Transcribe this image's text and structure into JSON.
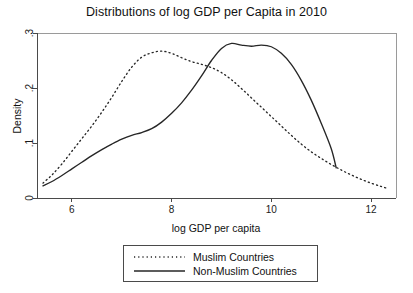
{
  "chart_data": {
    "type": "line",
    "title": "Distributions of log GDP per Capita in 2010",
    "xlabel": "log GDP per capita",
    "ylabel": "Density",
    "xlim": [
      5.3,
      12.5
    ],
    "ylim": [
      0,
      0.3
    ],
    "xticks": [
      "6",
      "8",
      "10",
      "12"
    ],
    "xtick_values": [
      6,
      8,
      10,
      12
    ],
    "yticks": [
      "0",
      ".1",
      ".2",
      ".3"
    ],
    "ytick_values": [
      0,
      0.1,
      0.2,
      0.3
    ],
    "grid": false,
    "legend_position": "below-axes",
    "series": [
      {
        "name": "Muslim Countries",
        "style": "dotted",
        "color": "#262626",
        "x": [
          5.42,
          5.6,
          5.8,
          6.0,
          6.2,
          6.4,
          6.6,
          6.8,
          7.0,
          7.2,
          7.4,
          7.6,
          7.8,
          8.0,
          8.2,
          8.4,
          8.6,
          8.8,
          9.0,
          9.2,
          9.4,
          9.6,
          9.8,
          10.0,
          10.2,
          10.4,
          10.6,
          10.8,
          11.0,
          11.2,
          11.4,
          11.6,
          11.8,
          12.0,
          12.2,
          12.35
        ],
        "y": [
          0.027,
          0.042,
          0.062,
          0.085,
          0.108,
          0.131,
          0.156,
          0.183,
          0.212,
          0.238,
          0.256,
          0.264,
          0.267,
          0.263,
          0.255,
          0.248,
          0.243,
          0.237,
          0.228,
          0.215,
          0.199,
          0.182,
          0.165,
          0.148,
          0.131,
          0.114,
          0.098,
          0.084,
          0.072,
          0.061,
          0.051,
          0.042,
          0.034,
          0.027,
          0.021,
          0.017
        ]
      },
      {
        "name": "Non-Muslim Countries",
        "style": "solid",
        "color": "#262626",
        "x": [
          5.42,
          5.6,
          5.8,
          6.0,
          6.2,
          6.4,
          6.6,
          6.8,
          7.0,
          7.2,
          7.4,
          7.6,
          7.8,
          8.0,
          8.2,
          8.4,
          8.6,
          8.8,
          9.0,
          9.2,
          9.4,
          9.6,
          9.8,
          10.0,
          10.2,
          10.4,
          10.6,
          10.8,
          11.0,
          11.2,
          11.3
        ],
        "y": [
          0.022,
          0.03,
          0.041,
          0.053,
          0.065,
          0.077,
          0.088,
          0.098,
          0.107,
          0.114,
          0.119,
          0.126,
          0.138,
          0.154,
          0.173,
          0.196,
          0.222,
          0.25,
          0.272,
          0.281,
          0.278,
          0.276,
          0.278,
          0.275,
          0.263,
          0.243,
          0.214,
          0.178,
          0.136,
          0.09,
          0.055
        ]
      }
    ]
  },
  "legend": {
    "entries": [
      {
        "label": "Muslim Countries",
        "style": "dotted"
      },
      {
        "label": "Non-Muslim Countries",
        "style": "solid"
      }
    ]
  }
}
